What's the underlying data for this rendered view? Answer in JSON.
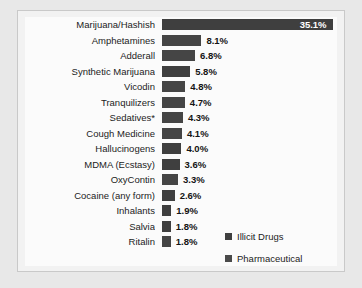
{
  "chart_data": {
    "type": "bar",
    "orientation": "horizontal",
    "title": "",
    "subtitle": "",
    "xlabel": "",
    "ylabel": "",
    "grid": false,
    "xlim": [
      0,
      36
    ],
    "value_suffix": "%",
    "legend_position": "inside-bottom-right",
    "categories": [
      "Marijuana/Hashish",
      "Amphetamines",
      "Adderall",
      "Synthetic Marijuana",
      "Vicodin",
      "Tranquilizers",
      "Sedatives*",
      "Cough Medicine",
      "Hallucinogens",
      "MDMA (Ecstasy)",
      "OxyContin",
      "Cocaine (any form)",
      "Inhalants",
      "Salvia",
      "Ritalin"
    ],
    "values": [
      35.1,
      8.1,
      6.8,
      5.8,
      4.8,
      4.7,
      4.3,
      4.1,
      4.0,
      3.6,
      3.3,
      2.6,
      1.9,
      1.8,
      1.8
    ],
    "value_labels": [
      "35.1%",
      "8.1%",
      "6.8%",
      "5.8%",
      "4.8%",
      "4.7%",
      "4.3%",
      "4.1%",
      "4.0%",
      "3.6%",
      "3.3%",
      "2.6%",
      "1.9%",
      "1.8%",
      "1.8%"
    ],
    "series_of_bar": [
      "Illicit Drugs",
      "Pharmaceutical",
      "Pharmaceutical",
      "Illicit Drugs",
      "Pharmaceutical",
      "Pharmaceutical",
      "Pharmaceutical",
      "Pharmaceutical",
      "Illicit Drugs",
      "Illicit Drugs",
      "Pharmaceutical",
      "Illicit Drugs",
      "Illicit Drugs",
      "Illicit Drugs",
      "Pharmaceutical"
    ],
    "legend": [
      {
        "name": "Illicit Drugs",
        "color": "#3f3f3f"
      },
      {
        "name": "Pharmaceutical",
        "color": "#4a4a4a"
      }
    ]
  },
  "colors": {
    "page_background": "#e8e8e8",
    "frame_background": "#f2f2f2",
    "plot_background": "#fbfbfb",
    "frame_border": "#c9c9c9",
    "bar_illicit": "#3f3f3f",
    "bar_pharmaceutical": "#4a4a4a",
    "label_text": "#1c1c1c",
    "inside_value_text": "#ffffff"
  }
}
